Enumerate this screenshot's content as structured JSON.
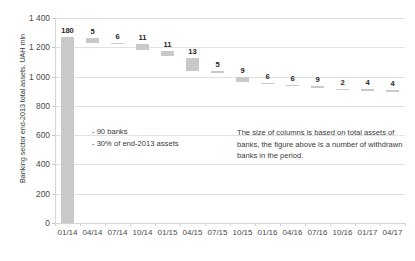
{
  "chart_data": {
    "type": "bar",
    "title": "",
    "xlabel": "",
    "ylabel": "Banking sector end-2013 total assets, UAH mln",
    "ylim": [
      0,
      1400
    ],
    "grid": true,
    "legend": "none",
    "y_ticks": [
      "0",
      "200",
      "400",
      "600",
      "800",
      "1 000",
      "1 200",
      "1 400"
    ],
    "y_tick_values": [
      0,
      200,
      400,
      600,
      800,
      1000,
      1200,
      1400
    ],
    "categories": [
      "01/14",
      "04/14",
      "07/14",
      "10/14",
      "01/15",
      "04/15",
      "07/15",
      "10/15",
      "01/16",
      "04/16",
      "07/16",
      "10/16",
      "01/17",
      "04/17"
    ],
    "bar_labels": [
      "180",
      "5",
      "6",
      "11",
      "11",
      "13",
      "5",
      "9",
      "6",
      "6",
      "9",
      "2",
      "4",
      "4"
    ],
    "bar_label_meaning": "number of withdrawn banks in the period",
    "series": [
      {
        "name": "Banking sector end-2013 total assets, UAH mln",
        "bars": [
          {
            "category": "01/14",
            "label": "180",
            "top": 1270,
            "bottom": 0,
            "value": 1270
          },
          {
            "category": "04/14",
            "label": "5",
            "top": 1265,
            "bottom": 1230,
            "value": 35
          },
          {
            "category": "07/14",
            "label": "6",
            "top": 1228,
            "bottom": 1222,
            "value": 6
          },
          {
            "category": "10/14",
            "label": "11",
            "top": 1220,
            "bottom": 1180,
            "value": 40
          },
          {
            "category": "01/15",
            "label": "11",
            "top": 1178,
            "bottom": 1140,
            "value": 38
          },
          {
            "category": "04/15",
            "label": "13",
            "top": 1130,
            "bottom": 1040,
            "value": 90
          },
          {
            "category": "07/15",
            "label": "5",
            "top": 1035,
            "bottom": 1028,
            "value": 7
          },
          {
            "category": "10/15",
            "label": "9",
            "top": 1000,
            "bottom": 960,
            "value": 40
          },
          {
            "category": "01/16",
            "label": "6",
            "top": 958,
            "bottom": 950,
            "value": 8
          },
          {
            "category": "04/16",
            "label": "6",
            "top": 945,
            "bottom": 938,
            "value": 7
          },
          {
            "category": "07/16",
            "label": "9",
            "top": 935,
            "bottom": 920,
            "value": 15
          },
          {
            "category": "10/16",
            "label": "2",
            "top": 918,
            "bottom": 915,
            "value": 3
          },
          {
            "category": "01/17",
            "label": "4",
            "top": 912,
            "bottom": 908,
            "value": 4
          },
          {
            "category": "04/17",
            "label": "4",
            "top": 905,
            "bottom": 898,
            "value": 7
          }
        ]
      }
    ],
    "annotations": [
      {
        "id": "left",
        "text": "- 90 banks\n- 30% of end-2013 assets"
      },
      {
        "id": "right",
        "text": "The size of columns is based on total assets of banks, the figure above is a number of withdrawn banks in the period."
      }
    ],
    "colors": {
      "bar": "#c9c9c9",
      "gridline": "#e2e2e2",
      "axis": "#d6d6d6",
      "text": "#3b3b3b",
      "background": "#ffffff"
    }
  }
}
